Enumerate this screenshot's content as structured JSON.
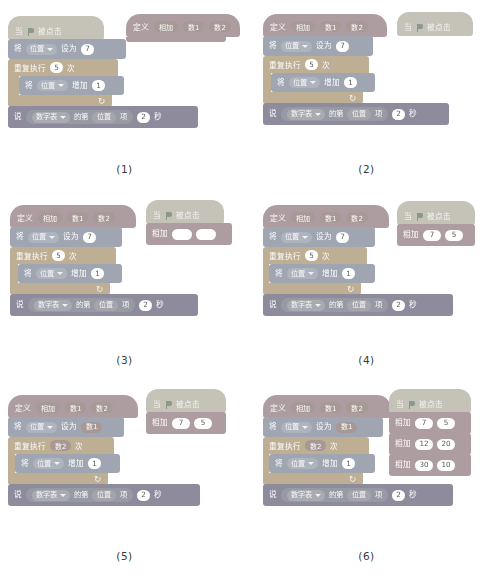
{
  "figure": {
    "type": "scratch-block-programming-steps",
    "panel_count": 6
  },
  "labels": {
    "define": "定义",
    "add_proc": "相加",
    "param1": "数1",
    "param2": "数2",
    "when": "当",
    "flag_clicked": "被点击",
    "set_to_prefix": "将",
    "position": "位置",
    "set_to": "设为",
    "repeat": "重复执行",
    "times": "次",
    "change_by": "增加",
    "say": "说",
    "number_list": "数字表",
    "item_of": "的第",
    "item_tail": "项",
    "seconds": "秒",
    "flag_icon": "green-flag-icon",
    "loop_icon": "loop-arrow-icon",
    "dropdown_icon": "chevron-down-icon"
  },
  "values": {
    "set_7": "7",
    "repeat_5": "5",
    "change_1": "1",
    "say_2": "2",
    "call_7": "7",
    "call_5": "5",
    "call_12": "12",
    "call_20": "20",
    "call_30": "30",
    "call_10": "10",
    "empty": ""
  },
  "captions": {
    "p1": "(1)",
    "p2": "(2)",
    "p3": "(3)",
    "p4": "(4)",
    "p5": "(5)",
    "p6": "(6)"
  },
  "colors": {
    "motion": "#9aa6bd",
    "looks": "#8e8ba8",
    "control": "#c9ad7e",
    "custom": "#b99a9f",
    "events": "#c8c2ac",
    "variables": "#c2a07f",
    "page_background": "#ffffff",
    "block_text": "#fdfdfd",
    "input_background": "#ffffff"
  },
  "panels": [
    {
      "id": "1",
      "description": "Flag script with position set/repeat/say; separate empty define block at right",
      "has_define_attached": false,
      "define_standalone": true,
      "set_value": "7",
      "repeat_value": "5",
      "call_blocks": []
    },
    {
      "id": "2",
      "description": "Define block attached on top of the script; flag hat standing alone",
      "has_define_attached": true,
      "define_standalone": false,
      "set_value": "7",
      "repeat_value": "5",
      "call_blocks": []
    },
    {
      "id": "3",
      "description": "Flag hat with empty 相加 call block having two blank inputs",
      "has_define_attached": true,
      "define_standalone": false,
      "set_value": "7",
      "repeat_value": "5",
      "call_blocks": [
        {
          "a": "",
          "b": ""
        }
      ]
    },
    {
      "id": "4",
      "description": "Flag hat with 相加 7 5 call block",
      "has_define_attached": true,
      "define_standalone": false,
      "set_value": "7",
      "repeat_value": "5",
      "call_blocks": [
        {
          "a": "7",
          "b": "5"
        }
      ]
    },
    {
      "id": "5",
      "description": "Definition now uses parameters 数1 and 数2 in place of literals",
      "has_define_attached": true,
      "define_standalone": false,
      "set_value": "数1",
      "repeat_value": "数2",
      "call_blocks": [
        {
          "a": "7",
          "b": "5"
        }
      ]
    },
    {
      "id": "6",
      "description": "Three stacked 相加 calls with different arguments",
      "has_define_attached": true,
      "define_standalone": false,
      "set_value": "数1",
      "repeat_value": "数2",
      "call_blocks": [
        {
          "a": "7",
          "b": "5"
        },
        {
          "a": "12",
          "b": "20"
        },
        {
          "a": "30",
          "b": "10"
        }
      ]
    }
  ]
}
